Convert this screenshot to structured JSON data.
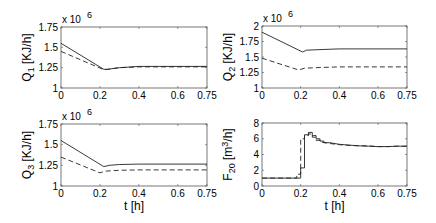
{
  "chart_data": [
    {
      "type": "line",
      "panel": "top-left",
      "xlabel": "",
      "ylabel": "Q_1 [KJ/h]",
      "ylabel_main": "Q",
      "ylabel_sub": "1",
      "ylabel_unit": " [KJ/h]",
      "exponent_label": "x 10",
      "exponent": "6",
      "xlim": [
        0,
        0.75
      ],
      "ylim": [
        1,
        1.75
      ],
      "xticks": [
        "0",
        "0.2",
        "0.4",
        "0.6",
        "0.75"
      ],
      "xtick_values": [
        0,
        0.2,
        0.4,
        0.6,
        0.75
      ],
      "yticks": [
        "1",
        "1.25",
        "1.5",
        "1.75"
      ],
      "ytick_values": [
        1,
        1.25,
        1.5,
        1.75
      ],
      "series": [
        {
          "name": "solid",
          "style": "solid",
          "x": [
            0,
            0.22,
            0.24,
            0.3,
            0.4,
            0.5,
            0.75
          ],
          "y": [
            1.55,
            1.23,
            1.23,
            1.25,
            1.265,
            1.265,
            1.265
          ]
        },
        {
          "name": "dashed",
          "style": "dashed",
          "x": [
            0,
            0.22,
            0.24,
            0.3,
            0.4,
            0.5,
            0.75
          ],
          "y": [
            1.45,
            1.225,
            1.23,
            1.25,
            1.26,
            1.26,
            1.26
          ]
        }
      ]
    },
    {
      "type": "line",
      "panel": "top-right",
      "xlabel": "",
      "ylabel": "Q_2 [KJ/h]",
      "ylabel_main": "Q",
      "ylabel_sub": "2",
      "ylabel_unit": " [KJ/h]",
      "exponent_label": "x 10",
      "exponent": "6",
      "xlim": [
        0,
        0.75
      ],
      "ylim": [
        1,
        2
      ],
      "xticks": [
        "0",
        "0.2",
        "0.4",
        "0.6",
        "0.75"
      ],
      "xtick_values": [
        0,
        0.2,
        0.4,
        0.6,
        0.75
      ],
      "yticks": [
        "1",
        "1.25",
        "1.5",
        "1.75",
        "2"
      ],
      "ytick_values": [
        1,
        1.25,
        1.5,
        1.75,
        2
      ],
      "series": [
        {
          "name": "solid",
          "style": "solid",
          "x": [
            0,
            0.21,
            0.23,
            0.3,
            0.4,
            0.75
          ],
          "y": [
            1.9,
            1.58,
            1.61,
            1.62,
            1.63,
            1.63
          ]
        },
        {
          "name": "dashed",
          "style": "dashed",
          "x": [
            0,
            0.19,
            0.22,
            0.3,
            0.4,
            0.75
          ],
          "y": [
            1.48,
            1.29,
            1.32,
            1.33,
            1.34,
            1.34
          ]
        }
      ]
    },
    {
      "type": "line",
      "panel": "bottom-left",
      "xlabel": "t [h]",
      "ylabel": "Q_3 [KJ/h]",
      "ylabel_main": "Q",
      "ylabel_sub": "3",
      "ylabel_unit": " [KJ/h]",
      "exponent_label": "x 10",
      "exponent": "6",
      "xlim": [
        0,
        0.75
      ],
      "ylim": [
        1,
        1.75
      ],
      "xticks": [
        "0",
        "0.2",
        "0.4",
        "0.6",
        "0.75"
      ],
      "xtick_values": [
        0,
        0.2,
        0.4,
        0.6,
        0.75
      ],
      "yticks": [
        "1",
        "1.25",
        "1.5",
        "1.75"
      ],
      "ytick_values": [
        1,
        1.25,
        1.5,
        1.75
      ],
      "series": [
        {
          "name": "solid",
          "style": "solid",
          "x": [
            0,
            0.22,
            0.25,
            0.3,
            0.4,
            0.75
          ],
          "y": [
            1.55,
            1.235,
            1.25,
            1.26,
            1.265,
            1.265
          ]
        },
        {
          "name": "dashed",
          "style": "dashed",
          "x": [
            0,
            0.2,
            0.23,
            0.3,
            0.4,
            0.75
          ],
          "y": [
            1.35,
            1.16,
            1.18,
            1.19,
            1.195,
            1.195
          ]
        }
      ]
    },
    {
      "type": "line",
      "panel": "bottom-right",
      "xlabel": "t [h]",
      "ylabel": "F_20 [m^3/h]",
      "ylabel_main": "F",
      "ylabel_sub": "20",
      "ylabel_unit_pre": " [m",
      "ylabel_unit_sup": "3",
      "ylabel_unit_post": "/h]",
      "xlim": [
        0,
        0.75
      ],
      "ylim": [
        0,
        8
      ],
      "xticks": [
        "0",
        "0.2",
        "0.4",
        "0.6",
        "0.75"
      ],
      "xtick_values": [
        0,
        0.2,
        0.4,
        0.6,
        0.75
      ],
      "yticks": [
        "0",
        "2",
        "4",
        "6",
        "8"
      ],
      "ytick_values": [
        0,
        2,
        4,
        6,
        8
      ],
      "series": [
        {
          "name": "solid",
          "style": "step",
          "x": [
            0,
            0.2,
            0.2,
            0.22,
            0.22,
            0.24,
            0.24,
            0.26,
            0.26,
            0.28,
            0.28,
            0.3,
            0.3,
            0.32,
            0.32,
            0.35,
            0.4,
            0.45,
            0.5,
            0.55,
            0.6,
            0.65,
            0.7,
            0.75
          ],
          "y": [
            1,
            1,
            2.3,
            2.3,
            6.5,
            6.5,
            6.8,
            6.8,
            6.4,
            6.4,
            6.0,
            6.0,
            5.7,
            5.7,
            5.5,
            5.5,
            5.3,
            5.2,
            5.1,
            5.05,
            5.0,
            5.0,
            5.05,
            5.05
          ]
        },
        {
          "name": "dashed",
          "style": "step",
          "x": [
            0,
            0.18,
            0.18,
            0.2,
            0.2,
            0.22,
            0.22,
            0.24,
            0.24,
            0.26,
            0.26,
            0.28,
            0.28,
            0.3,
            0.3,
            0.35,
            0.4,
            0.45,
            0.5,
            0.55,
            0.6,
            0.65,
            0.7,
            0.75
          ],
          "y": [
            1,
            1,
            1.5,
            1.5,
            6.0,
            6.0,
            6.4,
            6.4,
            6.6,
            6.6,
            6.2,
            6.2,
            5.8,
            5.8,
            5.6,
            5.4,
            5.25,
            5.15,
            5.1,
            5.1,
            5.0,
            5.0,
            5.05,
            5.05
          ]
        }
      ]
    }
  ],
  "layout": {
    "panels": [
      {
        "x0": 61,
        "x1": 207,
        "y0": 27,
        "y1": 88
      },
      {
        "x0": 262,
        "x1": 407,
        "y0": 26,
        "y1": 88
      },
      {
        "x0": 61,
        "x1": 207,
        "y0": 124,
        "y1": 186
      },
      {
        "x0": 262,
        "x1": 407,
        "y0": 123,
        "y1": 186
      }
    ],
    "line_color": "#222222",
    "axis_color": "#555555"
  }
}
